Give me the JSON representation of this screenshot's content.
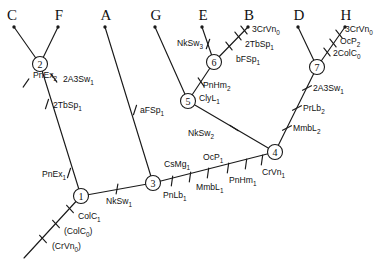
{
  "diagram": {
    "line_color": "#1a1a1a",
    "background": "#ffffff"
  },
  "tips": [
    {
      "id": "tip-C",
      "label": "C",
      "x": 12,
      "y": 20,
      "dot_x": 14,
      "dot_y": 27
    },
    {
      "id": "tip-F",
      "label": "F",
      "x": 59,
      "y": 20,
      "dot_x": 58,
      "dot_y": 27
    },
    {
      "id": "tip-A",
      "label": "A",
      "x": 106,
      "y": 20,
      "dot_x": 105,
      "dot_y": 27
    },
    {
      "id": "tip-G",
      "label": "G",
      "x": 156,
      "y": 20,
      "dot_x": 155,
      "dot_y": 27
    },
    {
      "id": "tip-E",
      "label": "E",
      "x": 203,
      "y": 20,
      "dot_x": 202,
      "dot_y": 27
    },
    {
      "id": "tip-B",
      "label": "B",
      "x": 249,
      "y": 20,
      "dot_x": 248,
      "dot_y": 27
    },
    {
      "id": "tip-D",
      "label": "D",
      "x": 299,
      "y": 20,
      "dot_x": 298,
      "dot_y": 27
    },
    {
      "id": "tip-H",
      "label": "H",
      "x": 346,
      "y": 20,
      "dot_x": 345,
      "dot_y": 27
    }
  ],
  "nodes": [
    {
      "id": "node-1",
      "label": "1",
      "x": 81,
      "y": 196,
      "r": 7.5
    },
    {
      "id": "node-2",
      "label": "2",
      "x": 40,
      "y": 64,
      "r": 7.5
    },
    {
      "id": "node-3",
      "label": "3",
      "x": 153,
      "y": 183,
      "r": 7.5
    },
    {
      "id": "node-4",
      "label": "4",
      "x": 275,
      "y": 152,
      "r": 7.5
    },
    {
      "id": "node-5",
      "label": "5",
      "x": 188,
      "y": 101,
      "r": 7.5
    },
    {
      "id": "node-6",
      "label": "6",
      "x": 214,
      "y": 62,
      "r": 7.5
    },
    {
      "id": "node-7",
      "label": "7",
      "x": 317,
      "y": 67,
      "r": 7.5
    }
  ],
  "branches": [
    {
      "id": "branch-root",
      "x1": 81,
      "y1": 196,
      "x2": 24,
      "y2": 258
    },
    {
      "id": "branch-1-2",
      "x1": 81,
      "y1": 196,
      "x2": 40,
      "y2": 64
    },
    {
      "id": "branch-2-C",
      "x1": 40,
      "y1": 64,
      "x2": 14,
      "y2": 27
    },
    {
      "id": "branch-2-F",
      "x1": 40,
      "y1": 64,
      "x2": 58,
      "y2": 27
    },
    {
      "id": "branch-1-3",
      "x1": 81,
      "y1": 196,
      "x2": 153,
      "y2": 183
    },
    {
      "id": "branch-3-A",
      "x1": 153,
      "y1": 183,
      "x2": 105,
      "y2": 27
    },
    {
      "id": "branch-3-4",
      "x1": 153,
      "y1": 183,
      "x2": 275,
      "y2": 152
    },
    {
      "id": "branch-4-5",
      "x1": 275,
      "y1": 152,
      "x2": 188,
      "y2": 101
    },
    {
      "id": "branch-5-G",
      "x1": 188,
      "y1": 101,
      "x2": 155,
      "y2": 27
    },
    {
      "id": "branch-5-6",
      "x1": 188,
      "y1": 101,
      "x2": 214,
      "y2": 62
    },
    {
      "id": "branch-6-E",
      "x1": 214,
      "y1": 62,
      "x2": 202,
      "y2": 27
    },
    {
      "id": "branch-6-B",
      "x1": 214,
      "y1": 62,
      "x2": 248,
      "y2": 27
    },
    {
      "id": "branch-4-7",
      "x1": 275,
      "y1": 152,
      "x2": 317,
      "y2": 67
    },
    {
      "id": "branch-7-D",
      "x1": 317,
      "y1": 67,
      "x2": 298,
      "y2": 27
    },
    {
      "id": "branch-7-H",
      "x1": 317,
      "y1": 67,
      "x2": 345,
      "y2": 27
    }
  ],
  "characters": [
    {
      "id": "char-PnEx2",
      "text": "PnEx",
      "sub": "2",
      "tick_x": 26,
      "tick_y": 83,
      "tick_angle": 55,
      "label_x": 33,
      "label_y": 75,
      "anchor": "start"
    },
    {
      "id": "char-2A3Sw1-CF",
      "text": "2A3Sw",
      "sub": "1",
      "tick_x": 54,
      "tick_y": 78,
      "tick_angle": 125,
      "label_x": 63,
      "label_y": 79,
      "anchor": "start"
    },
    {
      "id": "char-2TbSp1-1",
      "text": "2TbSp",
      "sub": "1",
      "tick_x": 47,
      "tick_y": 104,
      "tick_angle": 72,
      "label_x": 53,
      "label_y": 105,
      "anchor": "start"
    },
    {
      "id": "char-PnEx1",
      "text": "PnEx",
      "sub": "1",
      "tick_x": 69,
      "tick_y": 173,
      "tick_angle": 72,
      "label_x": 42,
      "label_y": 174,
      "anchor": "start"
    },
    {
      "id": "char-ColC1",
      "text": "ColC",
      "sub": "1",
      "tick_x": 70,
      "tick_y": 209,
      "tick_angle": 132,
      "label_x": 78,
      "label_y": 216,
      "anchor": "start"
    },
    {
      "id": "char-ColC0",
      "text": "(ColC",
      "sub": "0",
      "tail": ")",
      "tick_x": 56,
      "tick_y": 224,
      "tick_angle": 132,
      "label_x": 64,
      "label_y": 231,
      "anchor": "start"
    },
    {
      "id": "char-CrVn0",
      "text": "(CrVn",
      "sub": "0",
      "tail": ")",
      "tick_x": 43,
      "tick_y": 239,
      "tick_angle": 132,
      "label_x": 52,
      "label_y": 246,
      "anchor": "start"
    },
    {
      "id": "char-NkSw1",
      "text": "NkSw",
      "sub": "1",
      "tick_x": 117,
      "tick_y": 189,
      "tick_angle": 80,
      "label_x": 106,
      "label_y": 201,
      "anchor": "start"
    },
    {
      "id": "char-aFSp1",
      "text": "aFSp",
      "sub": "1",
      "tick_x": 135,
      "tick_y": 110,
      "tick_angle": 72,
      "label_x": 140,
      "label_y": 110,
      "anchor": "start"
    },
    {
      "id": "char-PnLb1",
      "text": "PnLb",
      "sub": "1",
      "tick_x": 172,
      "tick_y": 181,
      "tick_angle": 82,
      "label_x": 163,
      "label_y": 195,
      "anchor": "start"
    },
    {
      "id": "char-CsMg1",
      "text": "CsMg",
      "sub": "1",
      "tick_x": 190,
      "tick_y": 177,
      "tick_angle": 82,
      "label_x": 164,
      "label_y": 164,
      "anchor": "start"
    },
    {
      "id": "char-MmbL1",
      "text": "MmbL",
      "sub": "1",
      "tick_x": 208,
      "tick_y": 173,
      "tick_angle": 82,
      "label_x": 196,
      "label_y": 187,
      "anchor": "start"
    },
    {
      "id": "char-OcP1",
      "text": "OcP",
      "sub": "1",
      "tick_x": 228,
      "tick_y": 168,
      "tick_angle": 82,
      "label_x": 203,
      "label_y": 157,
      "anchor": "start"
    },
    {
      "id": "char-PnHm1",
      "text": "PnHm",
      "sub": "1",
      "tick_x": 246,
      "tick_y": 164,
      "tick_angle": 82,
      "label_x": 229,
      "label_y": 180,
      "anchor": "start"
    },
    {
      "id": "char-CrVn1",
      "text": "CrVn",
      "sub": "1",
      "tick_x": 262,
      "tick_y": 160,
      "tick_angle": 82,
      "label_x": 262,
      "label_y": 172,
      "anchor": "start"
    },
    {
      "id": "char-NkSw2",
      "text": "NkSw",
      "sub": "2",
      "tick_x": 234,
      "tick_y": 128,
      "tick_angle": 148,
      "label_x": 188,
      "label_y": 133,
      "anchor": "start"
    },
    {
      "id": "char-ClyL1",
      "text": "ClyL",
      "sub": "1",
      "tick_x": 201,
      "tick_y": 82,
      "tick_angle": 125,
      "label_x": 199,
      "label_y": 98,
      "anchor": "start"
    },
    {
      "id": "char-PnHm2",
      "text": "PnHm",
      "sub": "2",
      "tick_x": 201,
      "tick_y": 82,
      "tick_angle": 125,
      "label_x": 203,
      "label_y": 85,
      "anchor": "start",
      "no_tick": true
    },
    {
      "id": "char-NkSw3",
      "text": "NkSw",
      "sub": "3",
      "tick_x": 208,
      "tick_y": 44,
      "tick_angle": 70,
      "label_x": 177,
      "label_y": 43,
      "anchor": "start"
    },
    {
      "id": "char-bFSp1",
      "text": "bFSp",
      "sub": "1",
      "tick_x": 229,
      "tick_y": 46,
      "tick_angle": 128,
      "label_x": 236,
      "label_y": 59,
      "anchor": "start"
    },
    {
      "id": "char-2TbSp1-6",
      "text": "2TbSp",
      "sub": "1",
      "tick_x": 238,
      "tick_y": 36,
      "tick_angle": 128,
      "label_x": 245,
      "label_y": 44,
      "anchor": "start"
    },
    {
      "id": "char-3CrVn0-B",
      "text": "3CrVn",
      "sub": "0",
      "tick_x": 244,
      "tick_y": 30,
      "tick_angle": 128,
      "label_x": 252,
      "label_y": 29,
      "anchor": "start"
    },
    {
      "id": "char-MmbL2",
      "text": "MmbL",
      "sub": "2",
      "tick_x": 287,
      "tick_y": 128,
      "tick_angle": 28,
      "label_x": 293,
      "label_y": 128,
      "anchor": "start"
    },
    {
      "id": "char-PrLb2",
      "text": "PrLb",
      "sub": "2",
      "tick_x": 297,
      "tick_y": 108,
      "tick_angle": 28,
      "label_x": 303,
      "label_y": 108,
      "anchor": "start"
    },
    {
      "id": "char-2A3Sw1-7",
      "text": "2A3Sw",
      "sub": "1",
      "tick_x": 307,
      "tick_y": 88,
      "tick_angle": 28,
      "label_x": 313,
      "label_y": 88,
      "anchor": "start"
    },
    {
      "id": "char-2ColC0",
      "text": "2ColC",
      "sub": "0",
      "tick_x": 327,
      "tick_y": 52,
      "tick_angle": 128,
      "label_x": 333,
      "label_y": 53,
      "anchor": "start"
    },
    {
      "id": "char-OcP2",
      "text": "OcP",
      "sub": "2",
      "tick_x": 333,
      "tick_y": 43,
      "tick_angle": 128,
      "label_x": 340,
      "label_y": 41,
      "anchor": "start"
    },
    {
      "id": "char-3CrVn0-H",
      "text": "3CrVn",
      "sub": "0",
      "tick_x": 339,
      "tick_y": 34,
      "tick_angle": 128,
      "label_x": 345,
      "label_y": 29,
      "anchor": "start"
    }
  ]
}
